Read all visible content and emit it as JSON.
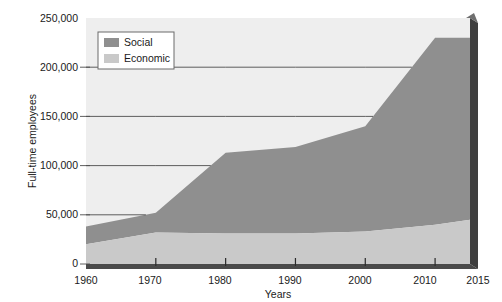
{
  "chart_data": {
    "type": "area",
    "title": "",
    "subtitle": "",
    "xlabel": "Years",
    "ylabel": "Full-time employees",
    "x": [
      1960,
      1970,
      1980,
      1990,
      2000,
      2010,
      2015
    ],
    "categories": [
      "1960",
      "1970",
      "1980",
      "1990",
      "2000",
      "2010",
      "2015"
    ],
    "stacked": true,
    "series": [
      {
        "name": "Economic",
        "color": "#c9c9c9",
        "values": [
          20000,
          32000,
          31000,
          31000,
          33000,
          40000,
          45000
        ]
      },
      {
        "name": "Social",
        "color": "#8f8f8f",
        "values": [
          18000,
          20000,
          82000,
          88000,
          107000,
          190000,
          185000
        ]
      }
    ],
    "totals": [
      38000,
      52000,
      113000,
      119000,
      140000,
      230000,
      230000
    ],
    "xlim": [
      1960,
      2015
    ],
    "ylim": [
      0,
      250000
    ],
    "ytick_labels": [
      "0",
      "50,000",
      "100,000",
      "150,000",
      "200,000",
      "250,000"
    ],
    "ytick_values": [
      0,
      50000,
      100000,
      150000,
      200000,
      250000
    ],
    "xtick_labels": [
      "1960",
      "1970",
      "1980",
      "1990",
      "2000",
      "2010",
      "2015"
    ],
    "grid": "horizontal",
    "legend_position": "top-left-inside",
    "legend_entries": [
      {
        "label": "Social",
        "color": "#8f8f8f"
      },
      {
        "label": "Economic",
        "color": "#c9c9c9"
      }
    ]
  },
  "axes": {
    "y_title": "Full-time employees",
    "x_title": "Years",
    "y_ticks": [
      {
        "label": "250,000",
        "value": 250000
      },
      {
        "label": "200,000",
        "value": 200000
      },
      {
        "label": "150,000",
        "value": 150000
      },
      {
        "label": "100,000",
        "value": 100000
      },
      {
        "label": "50,000",
        "value": 50000
      },
      {
        "label": "0",
        "value": 0
      }
    ],
    "x_ticks": [
      {
        "label": "1960",
        "value": 1960
      },
      {
        "label": "1970",
        "value": 1970
      },
      {
        "label": "1980",
        "value": 1980
      },
      {
        "label": "1990",
        "value": 1990
      },
      {
        "label": "2000",
        "value": 2000
      },
      {
        "label": "2010",
        "value": 2010
      },
      {
        "label": "2015",
        "value": 2015
      }
    ]
  },
  "legend": {
    "items": [
      {
        "label": "Social",
        "color": "#8f8f8f"
      },
      {
        "label": "Economic",
        "color": "#c9c9c9"
      }
    ]
  },
  "colors": {
    "social": "#8f8f8f",
    "economic": "#c9c9c9",
    "plot_background": "#eeeeee",
    "gridline": "#4d4d4d",
    "axis_bar": "#4a4a4a",
    "side_shadow": "#3f3f3f",
    "page_background": "#ffffff",
    "text": "#1a1a1a"
  }
}
